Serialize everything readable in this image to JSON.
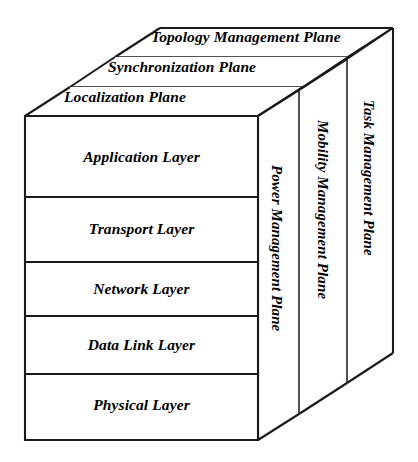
{
  "diagram": {
    "type": "3d-layered-cube",
    "line_color": "#1a1a1a",
    "face_color": "#ffffff",
    "text_color": "#000000"
  },
  "protocol_layers": [
    {
      "label": "Application Layer"
    },
    {
      "label": "Transport Layer"
    },
    {
      "label": "Network Layer"
    },
    {
      "label": "Data Link Layer"
    },
    {
      "label": "Physical Layer"
    }
  ],
  "top_planes": [
    {
      "label": "Topology Management Plane"
    },
    {
      "label": "Synchronization Plane"
    },
    {
      "label": "Localization Plane"
    }
  ],
  "side_planes": [
    {
      "label": "Power Management Plane"
    },
    {
      "label": "Mobility Management Plane"
    },
    {
      "label": "Task Management Plane"
    }
  ]
}
